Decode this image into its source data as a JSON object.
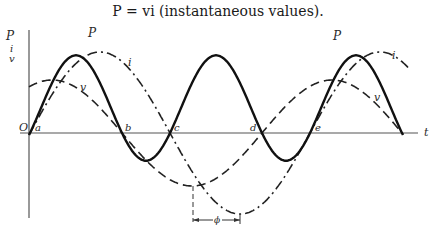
{
  "title": "P = vi (instantaneous values).",
  "axes": {
    "y_labels": [
      "P",
      "i",
      "v"
    ],
    "x_label": "t",
    "origin_label": "O"
  },
  "points": [
    {
      "label": "a",
      "x": 35,
      "y": 131
    },
    {
      "label": "b",
      "x": 125,
      "y": 131
    },
    {
      "label": "c",
      "x": 174,
      "y": 131
    },
    {
      "label": "d",
      "x": 250,
      "y": 131
    },
    {
      "label": "e",
      "x": 315,
      "y": 131
    }
  ],
  "curve_labels": [
    {
      "label": "P",
      "x": 88,
      "y": 37
    },
    {
      "label": "i",
      "x": 128,
      "y": 66
    },
    {
      "label": "v",
      "x": 80,
      "y": 91
    },
    {
      "label": "P",
      "x": 333,
      "y": 40
    },
    {
      "label": "i",
      "x": 392,
      "y": 59
    },
    {
      "label": "v",
      "x": 374,
      "y": 101
    }
  ],
  "phase_label": "ϕ",
  "chart_data": {
    "type": "line",
    "title": "P = vi (instantaneous values).",
    "xlabel": "t",
    "ylabel": "P, i, v",
    "series": [
      {
        "name": "v",
        "style": "long-dash",
        "amplitude": 53,
        "zeros_px": [
          122,
          262,
          402
        ]
      },
      {
        "name": "i",
        "style": "dash-dot",
        "amplitude": 81,
        "lag_phi_px": 48,
        "zeros_px": [
          170,
          310
        ]
      },
      {
        "name": "P",
        "style": "solid",
        "formula": "v*i"
      }
    ],
    "annotations": [
      "a",
      "b",
      "c",
      "d",
      "e",
      "ϕ",
      "O"
    ]
  }
}
